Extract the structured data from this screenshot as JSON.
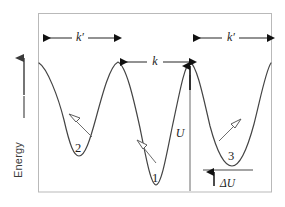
{
  "figure": {
    "axis": {
      "y_label": "Energy",
      "y_arrow": "up-arrow-icon"
    },
    "frame": {
      "x": 38,
      "y": 13,
      "width": 234,
      "height": 179,
      "stroke": "#b9b9b9"
    },
    "curve": {
      "stroke": "#444444",
      "stroke_width": 1.1
    },
    "labels": {
      "rate_k_prime_left": "k′",
      "rate_k": "k",
      "rate_k_prime_right": "k′",
      "barrier_U": "U",
      "energy_offset_delta_U": "ΔU",
      "well_2": "2",
      "well_1": "1",
      "well_3": "3"
    },
    "annotations": [
      {
        "name": "span-k-prime-left",
        "label": "k′",
        "x1": 41,
        "x2": 117,
        "y": 38,
        "text_x": 79,
        "style": "double-headed"
      },
      {
        "name": "span-k",
        "label": "k",
        "x1": 117,
        "x2": 192,
        "y": 62,
        "text_x": 155,
        "style": "double-headed-outward"
      },
      {
        "name": "span-k-prime-right",
        "label": "k′",
        "x1": 191,
        "x2": 269,
        "y": 38,
        "text_x": 230,
        "style": "double-headed"
      }
    ],
    "wells": [
      {
        "id": "well-2",
        "label": "2",
        "x": 78,
        "y": 155,
        "depth_rank": 2,
        "hop_arrow": "up-left"
      },
      {
        "id": "well-1",
        "label": "1",
        "x": 155,
        "y": 185,
        "depth_rank": 1,
        "hop_arrow": "up-left"
      },
      {
        "id": "well-3",
        "label": "3",
        "x": 232,
        "y": 165,
        "depth_rank": 3,
        "hop_arrow": "up-right"
      }
    ],
    "peaks": [
      {
        "id": "peak-left",
        "x": 118,
        "y": 62
      },
      {
        "id": "peak-right",
        "x": 190,
        "y": 62
      }
    ],
    "measures": {
      "U": {
        "x": 190,
        "y_top": 62,
        "y_bottom": 192,
        "label_x": 180,
        "label_y": 133
      },
      "delta_U": {
        "line_x1": 203,
        "line_x2": 253,
        "line_y": 170,
        "arrow_x": 214,
        "label_x": 220,
        "label_y": 183
      }
    },
    "colors": {
      "ink": "#3a3a3a",
      "curve": "#444444",
      "frame": "#b9b9b9",
      "arrow_thin": "#6e6e6e",
      "arrow_solid": "#111111",
      "background": "#ffffff"
    }
  }
}
